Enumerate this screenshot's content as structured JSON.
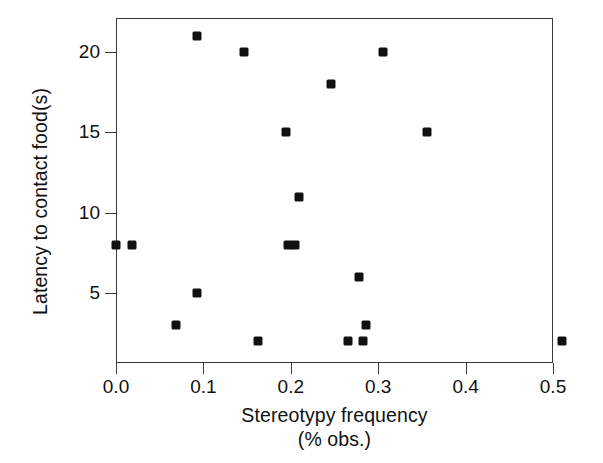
{
  "chart_data": {
    "type": "scatter",
    "title": "",
    "xlabel": "Stereotypy frequency (% obs.)",
    "xlabel_line1": "Stereotypy frequency",
    "xlabel_line2": "(% obs.)",
    "ylabel": "Latency to contact food(s)",
    "xlim": [
      -0.035,
      0.535
    ],
    "ylim": [
      1.1,
      22.4
    ],
    "grid": false,
    "legend": null,
    "x_ticks": [
      0.0,
      0.1,
      0.2,
      0.3,
      0.4,
      0.5
    ],
    "x_tick_labels": [
      "0.0",
      "0.1",
      "0.2",
      "0.3",
      "0.4",
      "0.5"
    ],
    "y_ticks": [
      5,
      10,
      15,
      20
    ],
    "y_tick_labels": [
      "5",
      "10",
      "15",
      "20"
    ],
    "marker": {
      "shape": "square",
      "color": "#111111",
      "size_px": 9
    },
    "points": [
      {
        "x": 0.0,
        "y": 8
      },
      {
        "x": 0.018,
        "y": 8
      },
      {
        "x": 0.069,
        "y": 3
      },
      {
        "x": 0.093,
        "y": 21
      },
      {
        "x": 0.093,
        "y": 5
      },
      {
        "x": 0.146,
        "y": 20
      },
      {
        "x": 0.162,
        "y": 2
      },
      {
        "x": 0.195,
        "y": 15
      },
      {
        "x": 0.197,
        "y": 8
      },
      {
        "x": 0.205,
        "y": 8
      },
      {
        "x": 0.209,
        "y": 11
      },
      {
        "x": 0.246,
        "y": 18
      },
      {
        "x": 0.265,
        "y": 2
      },
      {
        "x": 0.278,
        "y": 6
      },
      {
        "x": 0.283,
        "y": 2
      },
      {
        "x": 0.286,
        "y": 3
      },
      {
        "x": 0.306,
        "y": 20
      },
      {
        "x": 0.356,
        "y": 15
      },
      {
        "x": 0.51,
        "y": 2
      }
    ]
  },
  "colors": {
    "marker": "#111111",
    "axis": "#3a3a3a",
    "background": "#ffffff",
    "text": "#111111"
  }
}
